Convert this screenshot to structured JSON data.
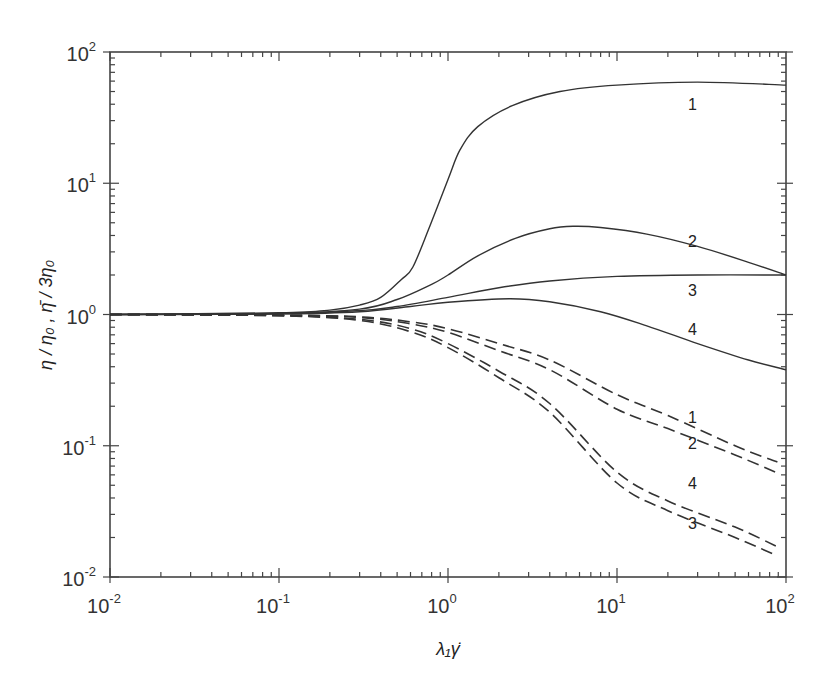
{
  "chart_data": {
    "type": "line",
    "title": "",
    "xlabel": "λ₁γ̇",
    "ylabel": "η / η₀ , η̄ / 3η₀",
    "xscale": "log",
    "yscale": "log",
    "xlim": [
      0.01,
      100
    ],
    "ylim": [
      0.01,
      100
    ],
    "x_ticks": [
      {
        "base": "10",
        "exp": "-2",
        "value": 0.01
      },
      {
        "base": "10",
        "exp": "-1",
        "value": 0.1
      },
      {
        "base": "10",
        "exp": "0",
        "value": 1
      },
      {
        "base": "10",
        "exp": "1",
        "value": 10
      },
      {
        "base": "10",
        "exp": "2",
        "value": 100
      }
    ],
    "y_ticks": [
      {
        "base": "10",
        "exp": "-2",
        "value": 0.01
      },
      {
        "base": "10",
        "exp": "-1",
        "value": 0.1
      },
      {
        "base": "10",
        "exp": "0",
        "value": 1
      },
      {
        "base": "10",
        "exp": "1",
        "value": 10
      },
      {
        "base": "10",
        "exp": "2",
        "value": 100
      }
    ],
    "grid": false,
    "legend": "inline curve labels",
    "series": [
      {
        "name": "1",
        "style": "solid",
        "quantity": "elongational viscosity / 3η0",
        "x": [
          0.01,
          0.1,
          0.2,
          0.3,
          0.4,
          0.53,
          0.62,
          0.78,
          1.0,
          1.18,
          1.5,
          2.4,
          4.6,
          10,
          30,
          100
        ],
        "y": [
          1.0,
          1.03,
          1.08,
          1.18,
          1.35,
          1.85,
          2.3,
          4.7,
          10.7,
          18,
          27,
          39,
          50,
          56,
          59,
          56
        ],
        "label_pos": {
          "x": 28,
          "y": 40
        }
      },
      {
        "name": "2",
        "style": "solid",
        "quantity": "elongational viscosity / 3η0",
        "x": [
          0.01,
          0.1,
          0.3,
          0.5,
          0.8,
          1.0,
          1.5,
          2.5,
          4,
          5.5,
          8,
          15,
          30,
          60,
          100
        ],
        "y": [
          1.0,
          1.02,
          1.1,
          1.3,
          1.7,
          2.0,
          2.8,
          3.8,
          4.5,
          4.7,
          4.6,
          4.1,
          3.3,
          2.5,
          2.0
        ],
        "label_pos": {
          "x": 28,
          "y": 3.6
        }
      },
      {
        "name": "3",
        "style": "solid",
        "quantity": "elongational viscosity / 3η0",
        "x": [
          0.01,
          0.1,
          0.3,
          0.5,
          1.0,
          2,
          4,
          10,
          30,
          100
        ],
        "y": [
          1.0,
          1.01,
          1.07,
          1.15,
          1.35,
          1.6,
          1.8,
          1.95,
          2.0,
          2.0
        ],
        "label_pos": {
          "x": 28,
          "y": 1.55
        }
      },
      {
        "name": "4",
        "style": "solid",
        "quantity": "elongational viscosity / 3η0",
        "x": [
          0.01,
          0.1,
          0.3,
          0.6,
          1.0,
          2.3,
          4,
          8,
          15,
          30,
          60,
          100
        ],
        "y": [
          1.0,
          1.01,
          1.05,
          1.15,
          1.24,
          1.32,
          1.25,
          1.05,
          0.82,
          0.6,
          0.45,
          0.38
        ],
        "label_pos": {
          "x": 28,
          "y": 0.78
        }
      },
      {
        "name": "1",
        "style": "dashed",
        "quantity": "shear viscosity / η0",
        "x": [
          0.01,
          0.1,
          0.3,
          0.6,
          1.0,
          2,
          4,
          10,
          20,
          50,
          89
        ],
        "y": [
          1.0,
          0.99,
          0.96,
          0.88,
          0.78,
          0.6,
          0.45,
          0.245,
          0.17,
          0.1,
          0.075
        ],
        "label_pos": {
          "x": 28,
          "y": 0.165
        }
      },
      {
        "name": "2",
        "style": "dashed",
        "quantity": "shear viscosity / η0",
        "x": [
          0.01,
          0.1,
          0.3,
          0.6,
          1.0,
          2,
          4,
          10,
          20,
          50,
          89
        ],
        "y": [
          1.0,
          0.99,
          0.95,
          0.85,
          0.73,
          0.53,
          0.38,
          0.19,
          0.135,
          0.085,
          0.062
        ],
        "label_pos": {
          "x": 28,
          "y": 0.105
        }
      },
      {
        "name": "4",
        "style": "dashed",
        "quantity": "shear viscosity / η0",
        "x": [
          0.01,
          0.1,
          0.3,
          0.6,
          1.0,
          2,
          4,
          10,
          20,
          50,
          89
        ],
        "y": [
          1.0,
          0.98,
          0.92,
          0.78,
          0.6,
          0.37,
          0.21,
          0.063,
          0.038,
          0.024,
          0.017
        ],
        "label_pos": {
          "x": 28,
          "y": 0.052
        }
      },
      {
        "name": "3",
        "style": "dashed",
        "quantity": "shear viscosity / η0",
        "x": [
          0.01,
          0.1,
          0.3,
          0.6,
          1.0,
          2,
          4,
          10,
          20,
          50,
          89
        ],
        "y": [
          1.0,
          0.98,
          0.9,
          0.74,
          0.56,
          0.33,
          0.18,
          0.052,
          0.032,
          0.02,
          0.0145
        ],
        "label_pos": {
          "x": 28,
          "y": 0.026
        }
      }
    ]
  },
  "colors": {
    "line": "#333333",
    "axis": "#444444",
    "background": "#ffffff"
  }
}
